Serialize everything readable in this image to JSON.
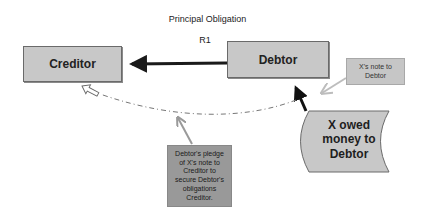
{
  "diagram": {
    "title": "Principal Obligation",
    "relation_label": "R1",
    "nodes": {
      "creditor": {
        "label": "Creditor"
      },
      "debtor": {
        "label": "Debtor"
      },
      "note": {
        "label": "X's note to Debtor"
      },
      "receivable": {
        "label_lines": [
          "X owed",
          "money to",
          "Debtor"
        ]
      },
      "pledge": {
        "label_lines": [
          "Debtor's pledge",
          "of X's note to",
          "Creditor to",
          "secure Debtor's",
          "obligations",
          "Creditor."
        ]
      }
    },
    "edges": [
      {
        "from": "debtor",
        "to": "creditor",
        "style": "thick-solid",
        "label": "R1"
      },
      {
        "from": "receivable",
        "to": "debtor",
        "style": "solid-dark"
      },
      {
        "from": "note",
        "to": "receivable-debtor-link",
        "style": "solid-light-gray"
      },
      {
        "from": "debtor",
        "to": "creditor",
        "style": "dashed-curve-hollow-arrow"
      },
      {
        "from": "pledge",
        "to": "dashed-curve",
        "style": "solid-gray"
      }
    ],
    "colors": {
      "box_fill": "#c8c8c8",
      "pledge_fill": "#999999",
      "arrow_dark": "#1a1a1a",
      "arrow_gray": "#9a9a9a",
      "callout_gray": "#bdbdbd"
    }
  }
}
